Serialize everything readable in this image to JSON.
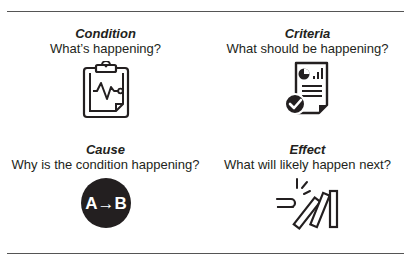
{
  "quadrants": [
    {
      "title": "Condition",
      "question": "What’s happening?",
      "icon": "clipboard-heartbeat-icon"
    },
    {
      "title": "Criteria",
      "question": "What should be happening?",
      "icon": "report-checkmark-icon"
    },
    {
      "title": "Cause",
      "question": "Why is the condition happening?",
      "icon": "a-to-b-icon",
      "icon_text": "A→B"
    },
    {
      "title": "Effect",
      "question": "What will likely happen next?",
      "icon": "falling-dominoes-icon"
    }
  ],
  "colors": {
    "ink": "#231f20",
    "rule": "#555555",
    "background": "#ffffff"
  }
}
